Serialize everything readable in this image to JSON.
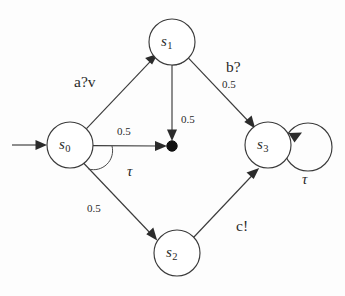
{
  "diagram": {
    "states": [
      {
        "id": "s0",
        "label": "s",
        "sub": "0",
        "cx": 70,
        "cy": 145,
        "r": 23
      },
      {
        "id": "s1",
        "label": "s",
        "sub": "1",
        "cx": 172,
        "cy": 42,
        "r": 23
      },
      {
        "id": "s2",
        "label": "s",
        "sub": "2",
        "cx": 177,
        "cy": 253,
        "r": 23
      },
      {
        "id": "s3",
        "label": "s",
        "sub": "3",
        "cx": 268,
        "cy": 145,
        "r": 23
      }
    ],
    "probabilistic_node": {
      "id": "branch-dot",
      "cx": 172,
      "cy": 146,
      "r": 5
    },
    "initial_marker": {
      "from_x": 12,
      "to_x": 47,
      "y": 145
    },
    "self_loops": [
      {
        "id": "s3-tau-loop",
        "on": "s3",
        "cx": 308,
        "cy": 147,
        "r": 24,
        "label": "τ"
      }
    ],
    "edge_labels": {
      "a_v": "a?v",
      "b": "b?",
      "c": "c!",
      "tau_s0": "τ",
      "tau_s3": "τ",
      "p_s0_dot": "0.5",
      "p_s0_s2": "0.5",
      "p_s1_dot": "0.5",
      "p_s1_s3": "0.5"
    },
    "transitions": [
      {
        "id": "t-init",
        "from": "start",
        "to": "s0",
        "action": "",
        "prob": ""
      },
      {
        "id": "t-s0-s1",
        "from": "s0",
        "to": "s1",
        "action": "a?v",
        "prob": ""
      },
      {
        "id": "t-s0-dot",
        "from": "s0",
        "to": "branch-dot",
        "action": "τ",
        "prob": "0.5"
      },
      {
        "id": "t-s0-s2",
        "from": "s0",
        "to": "s2",
        "action": "τ",
        "prob": "0.5"
      },
      {
        "id": "t-s1-dot",
        "from": "s1",
        "to": "branch-dot",
        "action": "b?",
        "prob": "0.5"
      },
      {
        "id": "t-s1-s3",
        "from": "s1",
        "to": "s3",
        "action": "b?",
        "prob": "0.5"
      },
      {
        "id": "t-s2-s3",
        "from": "s2",
        "to": "s3",
        "action": "c!",
        "prob": ""
      },
      {
        "id": "t-s3-s3",
        "from": "s3",
        "to": "s3",
        "action": "τ",
        "prob": ""
      }
    ],
    "colors": {
      "stroke": "#3b3b3b",
      "fill": "#ffffff",
      "text": "#2a2a2a",
      "dot": "#111111",
      "background": "#fdfdfd"
    }
  }
}
